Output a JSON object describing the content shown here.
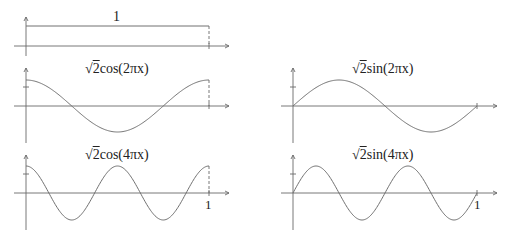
{
  "panels": [
    {
      "id": "box",
      "label": "1",
      "function": "constant",
      "amplitude": 1,
      "freq": 0
    },
    {
      "id": "cos2",
      "label_prefix": "√",
      "label_two": "2",
      "label_rest": "cos(2πx)",
      "function": "cos",
      "freq": 1
    },
    {
      "id": "sin2",
      "label_prefix": "√",
      "label_two": "2",
      "label_rest": "sin(2πx)",
      "function": "sin",
      "freq": 1
    },
    {
      "id": "cos4",
      "label_prefix": "√",
      "label_two": "2",
      "label_rest": "cos(4πx)",
      "function": "cos",
      "freq": 2,
      "x_end_label": "1"
    },
    {
      "id": "sin4",
      "label_prefix": "√",
      "label_two": "2",
      "label_rest": "sin(4πx)",
      "function": "sin",
      "freq": 2,
      "x_end_label": "1"
    }
  ],
  "chart_data": [
    {
      "type": "line",
      "title": "1",
      "x": [
        0,
        1
      ],
      "values": [
        1,
        1
      ],
      "xlim": [
        0,
        1
      ]
    },
    {
      "type": "line",
      "title": "√2cos(2πx)",
      "x": [
        0,
        0.25,
        0.5,
        0.75,
        1
      ],
      "values": [
        1.414,
        0,
        -1.414,
        0,
        1.414
      ],
      "xlim": [
        0,
        1
      ],
      "ticks_y": [
        1
      ]
    },
    {
      "type": "line",
      "title": "√2sin(2πx)",
      "x": [
        0,
        0.25,
        0.5,
        0.75,
        1
      ],
      "values": [
        0,
        1.414,
        0,
        -1.414,
        0
      ],
      "xlim": [
        0,
        1
      ],
      "ticks_y": [
        1
      ]
    },
    {
      "type": "line",
      "title": "√2cos(4πx)",
      "x": [
        0,
        0.125,
        0.25,
        0.375,
        0.5,
        0.625,
        0.75,
        0.875,
        1
      ],
      "values": [
        1.414,
        0,
        -1.414,
        0,
        1.414,
        0,
        -1.414,
        0,
        1.414
      ],
      "xlim": [
        0,
        1
      ],
      "x_tick_labels": [
        "1"
      ],
      "ticks_y": [
        1
      ]
    },
    {
      "type": "line",
      "title": "√2sin(4πx)",
      "x": [
        0,
        0.125,
        0.25,
        0.375,
        0.5,
        0.625,
        0.75,
        0.875,
        1
      ],
      "values": [
        0,
        1.414,
        0,
        -1.414,
        0,
        1.414,
        0,
        -1.414,
        0
      ],
      "xlim": [
        0,
        1
      ],
      "x_tick_labels": [
        "1"
      ],
      "ticks_y": [
        1
      ]
    }
  ]
}
